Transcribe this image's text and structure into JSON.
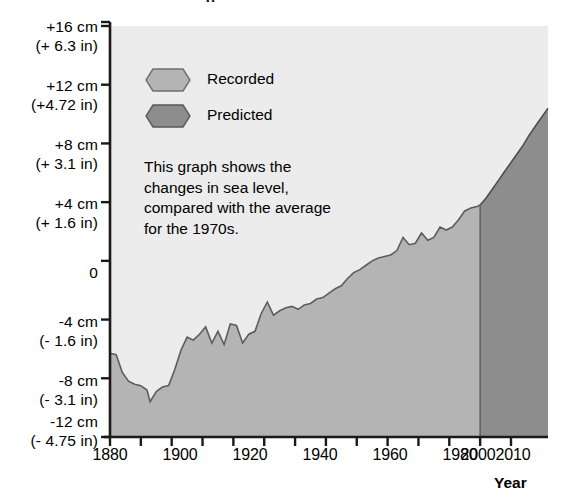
{
  "figure": {
    "background_color": "#ffffff",
    "plot_background_color": "#ececec",
    "axis_color": "#1a1a1a",
    "cropped_title_fragment": "g"
  },
  "legend": {
    "position": "inside-top-left",
    "items": [
      {
        "label": "Recorded",
        "color": "#b4b4b4",
        "icon": "hexagon-swatch"
      },
      {
        "label": "Predicted",
        "color": "#8d8d8d",
        "icon": "hexagon-swatch"
      }
    ]
  },
  "annotation": {
    "text": "This graph shows the\nchanges in sea level,\ncompared with the average\nfor the 1970s."
  },
  "axes": {
    "y": {
      "ticks": [
        {
          "cm": "+16 cm",
          "inches": "(+ 6.3 in)",
          "value": 16
        },
        {
          "cm": "+12 cm",
          "inches": "(+4.72 in)",
          "value": 12
        },
        {
          "cm": "+8 cm",
          "inches": "(+ 3.1 in)",
          "value": 8
        },
        {
          "cm": "+4 cm",
          "inches": "(+ 1.6 in)",
          "value": 4
        },
        {
          "cm": "0",
          "inches": "",
          "value": 0
        },
        {
          "cm": "-4 cm",
          "inches": "(- 1.6 in)",
          "value": -4
        },
        {
          "cm": "-8 cm",
          "inches": "(- 3.1 in)",
          "value": -8
        },
        {
          "cm": "-12 cm",
          "inches": "(- 4.75 in)",
          "value": -12
        }
      ],
      "min": -12,
      "max": 16
    },
    "x": {
      "title": "Year",
      "major_tick_labels": [
        "1880",
        "1900",
        "1920",
        "1940",
        "1960",
        "1980",
        "2000",
        "2010"
      ],
      "minor_tick_years": [
        1890,
        1910,
        1930,
        1950,
        1970,
        1990
      ],
      "min": 1880,
      "max": 2022
    }
  },
  "chart_data": {
    "type": "area",
    "xlabel": "Year",
    "ylabel": "Sea level change (cm)",
    "xlim": [
      1880,
      2022
    ],
    "ylim": [
      -12,
      16
    ],
    "grid": false,
    "legend_position": "inside-top-left",
    "units": {
      "primary": "cm",
      "secondary": "inches"
    },
    "baseline": -12,
    "split_year": 2000,
    "series": [
      {
        "name": "Recorded",
        "color": "#b4b4b4",
        "x": [
          1880,
          1882,
          1884,
          1886,
          1888,
          1890,
          1892,
          1893,
          1895,
          1897,
          1899,
          1901,
          1903,
          1905,
          1907,
          1909,
          1911,
          1913,
          1915,
          1917,
          1919,
          1921,
          1923,
          1925,
          1927,
          1929,
          1931,
          1933,
          1935,
          1937,
          1939,
          1941,
          1943,
          1945,
          1947,
          1949,
          1951,
          1953,
          1955,
          1957,
          1959,
          1961,
          1963,
          1965,
          1967,
          1969,
          1971,
          1973,
          1975,
          1977,
          1979,
          1981,
          1983,
          1985,
          1987,
          1989,
          1991,
          1993,
          1995,
          1997,
          1999,
          2000
        ],
        "values": [
          -6.3,
          -6.4,
          -7.6,
          -8.2,
          -8.4,
          -8.5,
          -8.8,
          -9.6,
          -8.9,
          -8.6,
          -8.5,
          -7.4,
          -6.1,
          -5.2,
          -5.4,
          -5.0,
          -4.5,
          -5.6,
          -4.8,
          -5.7,
          -4.3,
          -4.4,
          -5.6,
          -5.0,
          -4.8,
          -3.6,
          -2.8,
          -3.7,
          -3.4,
          -3.2,
          -3.1,
          -3.3,
          -3.0,
          -2.9,
          -2.6,
          -2.5,
          -2.2,
          -1.9,
          -1.7,
          -1.2,
          -0.8,
          -0.6,
          -0.3,
          0.0,
          0.2,
          0.3,
          0.4,
          0.7,
          1.6,
          1.1,
          1.2,
          1.9,
          1.4,
          1.6,
          2.3,
          2.1,
          2.3,
          2.8,
          3.4,
          3.6,
          3.7,
          3.8
        ]
      },
      {
        "name": "Predicted",
        "color": "#8d8d8d",
        "x": [
          2000,
          2002,
          2004,
          2006,
          2008,
          2010,
          2012,
          2014,
          2016,
          2018,
          2020,
          2022
        ],
        "values": [
          3.8,
          4.3,
          4.9,
          5.5,
          6.1,
          6.7,
          7.3,
          7.9,
          8.6,
          9.2,
          9.8,
          10.4
        ]
      }
    ]
  }
}
